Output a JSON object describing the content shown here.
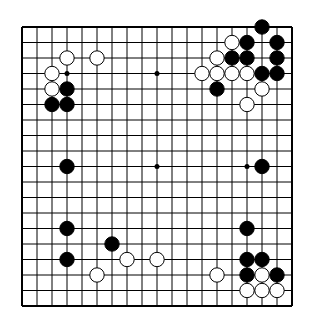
{
  "diagram": {
    "type": "go-board",
    "size": 19,
    "colors": {
      "background": "#ffffff",
      "line": "#000000",
      "black_stone": "#000000",
      "white_stone": "#ffffff"
    },
    "hoshi": [
      [
        3,
        3
      ],
      [
        3,
        9
      ],
      [
        3,
        15
      ],
      [
        9,
        3
      ],
      [
        9,
        9
      ],
      [
        9,
        15
      ],
      [
        15,
        3
      ],
      [
        15,
        9
      ],
      [
        15,
        15
      ]
    ],
    "black_stones": [
      [
        0,
        16
      ],
      [
        1,
        15
      ],
      [
        1,
        17
      ],
      [
        2,
        14
      ],
      [
        2,
        15
      ],
      [
        2,
        17
      ],
      [
        3,
        16
      ],
      [
        3,
        17
      ],
      [
        4,
        13
      ],
      [
        4,
        3
      ],
      [
        5,
        2
      ],
      [
        5,
        3
      ],
      [
        9,
        3
      ],
      [
        9,
        16
      ],
      [
        13,
        3
      ],
      [
        13,
        15
      ],
      [
        14,
        6
      ],
      [
        15,
        3
      ],
      [
        15,
        15
      ],
      [
        15,
        16
      ],
      [
        16,
        15
      ],
      [
        16,
        17
      ]
    ],
    "white_stones": [
      [
        1,
        14
      ],
      [
        2,
        3
      ],
      [
        2,
        5
      ],
      [
        2,
        13
      ],
      [
        3,
        2
      ],
      [
        3,
        12
      ],
      [
        3,
        13
      ],
      [
        3,
        14
      ],
      [
        3,
        15
      ],
      [
        4,
        2
      ],
      [
        4,
        16
      ],
      [
        5,
        15
      ],
      [
        15,
        7
      ],
      [
        15,
        9
      ],
      [
        16,
        5
      ],
      [
        16,
        13
      ],
      [
        16,
        16
      ],
      [
        17,
        15
      ],
      [
        17,
        16
      ],
      [
        17,
        17
      ]
    ]
  }
}
